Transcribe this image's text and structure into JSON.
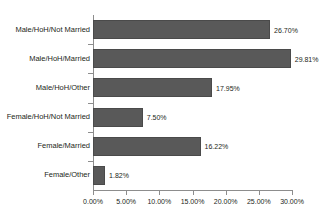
{
  "chart_data": {
    "type": "bar",
    "orientation": "horizontal",
    "title": "",
    "subtitle": "",
    "xlabel": "",
    "ylabel": "",
    "categories": [
      "Male/HoH/Not Married",
      "Male/HoH/Married",
      "Male/HoH/Other",
      "Female/HoH/Not Married",
      "Female/Married",
      "Female/Other"
    ],
    "values": [
      26.7,
      29.81,
      17.95,
      7.5,
      16.22,
      1.82
    ],
    "value_labels": [
      "26.70%",
      "29.81%",
      "17.95%",
      "7.50%",
      "16.22%",
      "1.82%"
    ],
    "xlim": [
      0,
      30
    ],
    "xticks": [
      0,
      5,
      10,
      15,
      20,
      25,
      30
    ],
    "xtick_labels": [
      "0.00%",
      "5.00%",
      "10.00%",
      "15.00%",
      "20.00%",
      "25.00%",
      "30.00%"
    ],
    "grid": false,
    "legend": false,
    "series": [
      {
        "name": "",
        "values": [
          26.7,
          29.81,
          17.95,
          7.5,
          16.22,
          1.82
        ]
      }
    ],
    "colors": {
      "bar_fill": "#595959",
      "bar_border": "#4a4a4a",
      "axis": "#8d8d8d",
      "text": "#231f20",
      "background": "#ffffff"
    }
  }
}
